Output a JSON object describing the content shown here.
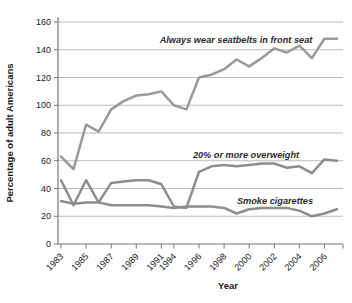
{
  "chart_data": {
    "type": "line",
    "title": "",
    "xlabel": "Year",
    "ylabel": "Percentage of adult Americans",
    "ylim": [
      0,
      160
    ],
    "ytick_step": 20,
    "grid": true,
    "legend": "inline-annotations",
    "categories": [
      1983,
      1984,
      1985,
      1986,
      1987,
      1988,
      1989,
      1990,
      1991,
      1994,
      1995,
      1996,
      1997,
      1998,
      1999,
      2000,
      2001,
      2002,
      2003,
      2004,
      2005,
      2006,
      2007
    ],
    "x_tick_labels": [
      "1983",
      "1985",
      "1987",
      "1989",
      "1991",
      "1994",
      "1996",
      "1998",
      "2000",
      "2002",
      "2004",
      "2006"
    ],
    "x_tick_indices": [
      0,
      2,
      4,
      6,
      8,
      9,
      11,
      13,
      15,
      17,
      19,
      21
    ],
    "series": [
      {
        "name": "Always wear seatbelts in front seat",
        "values": [
          63,
          54,
          86,
          81,
          97,
          103,
          107,
          108,
          110,
          100,
          97,
          120,
          122,
          126,
          133,
          128,
          134,
          141,
          138,
          143,
          134,
          148,
          148
        ]
      },
      {
        "name": "20% or more overweight",
        "values": [
          46,
          28,
          46,
          30,
          44,
          45,
          46,
          46,
          43,
          27,
          26,
          52,
          56,
          57,
          56,
          57,
          58,
          58,
          55,
          56,
          51,
          61,
          60
        ]
      },
      {
        "name": "Smoke cigarettes",
        "values": [
          31,
          29,
          30,
          30,
          28,
          28,
          28,
          28,
          27,
          26,
          27,
          27,
          27,
          26,
          22,
          25,
          26,
          26,
          26,
          24,
          20,
          22,
          25
        ]
      }
    ]
  },
  "colors": {
    "seatbelt_line": "#9a9a9a",
    "overweight_line": "#8d8d8d",
    "smoke_line": "#8d8d8d",
    "grid": "#b4b4b4",
    "axis": "#777777",
    "text": "#222222"
  }
}
